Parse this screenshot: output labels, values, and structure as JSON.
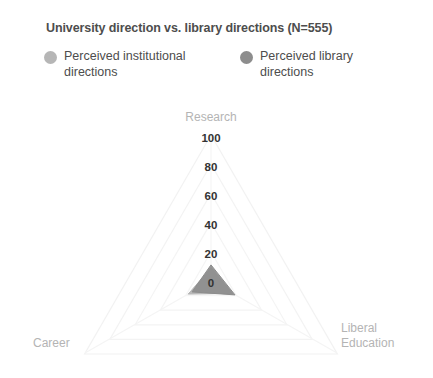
{
  "chart_title": "University direction vs. library directions (N=555)",
  "legend": {
    "entries": [
      {
        "label": "Perceived institutional directions",
        "color": "#b6b6b6",
        "marker": "circle-marker"
      },
      {
        "label": "Perceived library directions",
        "color": "#8d8d8d",
        "marker": "circle-marker"
      }
    ]
  },
  "axis_labels": {
    "research": "Research",
    "career": "Career",
    "liberal_education_line1": "Liberal",
    "liberal_education_line2": "Education"
  },
  "ticks": [
    "100",
    "80",
    "60",
    "40",
    "20",
    "0"
  ],
  "chart_data": {
    "type": "radar",
    "title": "University direction vs. library directions (N=555)",
    "subtitle": "",
    "xlabel": "",
    "ylabel": "",
    "categories": [
      "Research",
      "Career",
      "Liberal Education"
    ],
    "tick_labels": [
      "0",
      "20",
      "40",
      "60",
      "80",
      "100"
    ],
    "tick_values": [
      0,
      20,
      40,
      60,
      80,
      100
    ],
    "rlim": [
      0,
      100
    ],
    "grid": true,
    "legend_position": "top",
    "series": [
      {
        "name": "Perceived institutional directions",
        "color": "#b6b6b6",
        "values": [
          9,
          18,
          17
        ]
      },
      {
        "name": "Perceived library directions",
        "color": "#8d8d8d",
        "values": [
          11,
          15,
          19
        ]
      }
    ],
    "annotations": [
      "N=555"
    ],
    "grid_color": "#f2f2f2",
    "n": 555
  },
  "colors": {
    "background": "#ffffff",
    "title_text": "#4d4d4d",
    "tick_text": "#333333",
    "axis_label_text": "#b4b4b4",
    "series_light": "#b6b6b6",
    "series_dark": "#8d8d8d",
    "grid": "#f2f2f2"
  }
}
